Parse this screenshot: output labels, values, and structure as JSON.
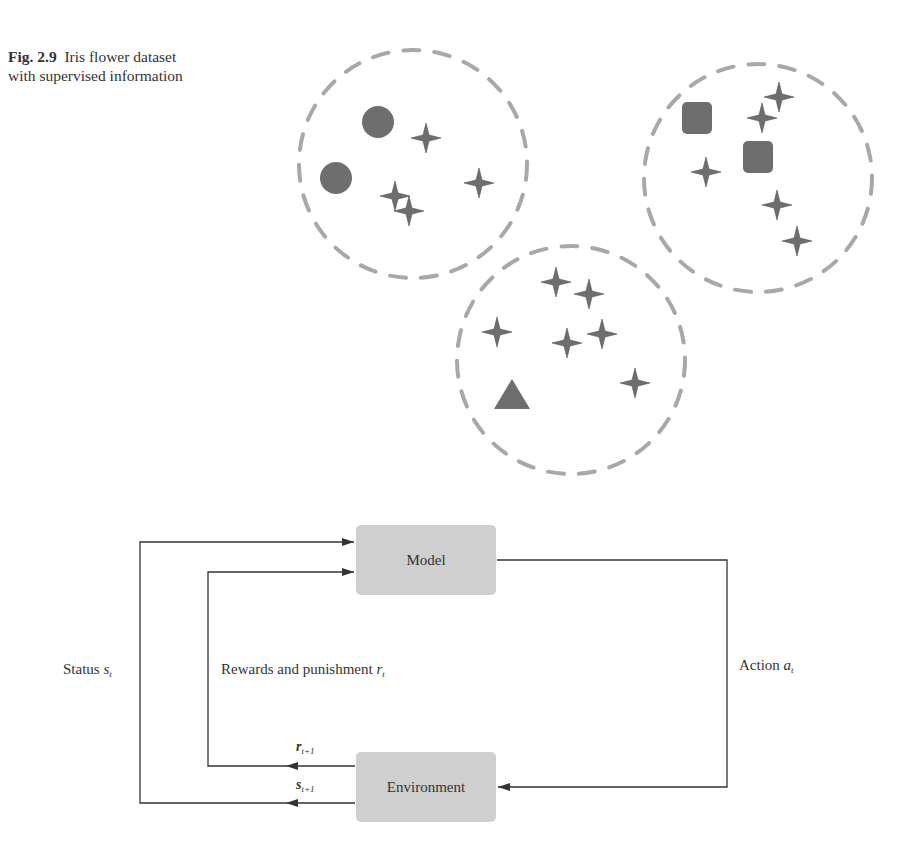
{
  "figure": {
    "number": "Fig. 2.9",
    "caption_line1": "Iris flower dataset",
    "caption_line2": "with supervised information"
  },
  "clusters": [
    {
      "name": "cluster-circles",
      "cx": 413,
      "cy": 164,
      "r": 114,
      "labeled": [
        {
          "shape": "circle",
          "x": 378,
          "y": 122
        },
        {
          "shape": "circle",
          "x": 336,
          "y": 178
        }
      ],
      "unlabeled": [
        [
          426,
          138
        ],
        [
          479,
          183
        ],
        [
          395,
          196
        ],
        [
          409,
          211
        ]
      ]
    },
    {
      "name": "cluster-squares",
      "cx": 758,
      "cy": 178,
      "r": 114,
      "labeled": [
        {
          "shape": "square",
          "x": 697,
          "y": 118
        },
        {
          "shape": "square",
          "x": 758,
          "y": 157
        }
      ],
      "unlabeled": [
        [
          779,
          97
        ],
        [
          762,
          118
        ],
        [
          706,
          172
        ],
        [
          777,
          205
        ],
        [
          797,
          241
        ]
      ]
    },
    {
      "name": "cluster-triangles",
      "cx": 571,
      "cy": 360,
      "r": 114,
      "labeled": [
        {
          "shape": "triangle",
          "x": 512,
          "y": 395
        }
      ],
      "unlabeled": [
        [
          556,
          282
        ],
        [
          589,
          294
        ],
        [
          497,
          332
        ],
        [
          567,
          343
        ],
        [
          602,
          334
        ],
        [
          635,
          383
        ]
      ]
    }
  ],
  "colors": {
    "marker": "#6e6e6e",
    "dash": "#a8a8a8",
    "box": "#cfcfcf",
    "line": "#333333"
  },
  "rl_diagram": {
    "model_label": "Model",
    "environment_label": "Environment",
    "status_label": "Status",
    "status_var": "s",
    "status_sub": "t",
    "reward_label": "Rewards and punishment",
    "reward_var": "r",
    "reward_sub": "t",
    "action_label": "Action",
    "action_var": "a",
    "action_sub": "t",
    "next_reward_var": "r",
    "next_reward_sub": "t+1",
    "next_state_var": "s",
    "next_state_sub": "t+1"
  }
}
